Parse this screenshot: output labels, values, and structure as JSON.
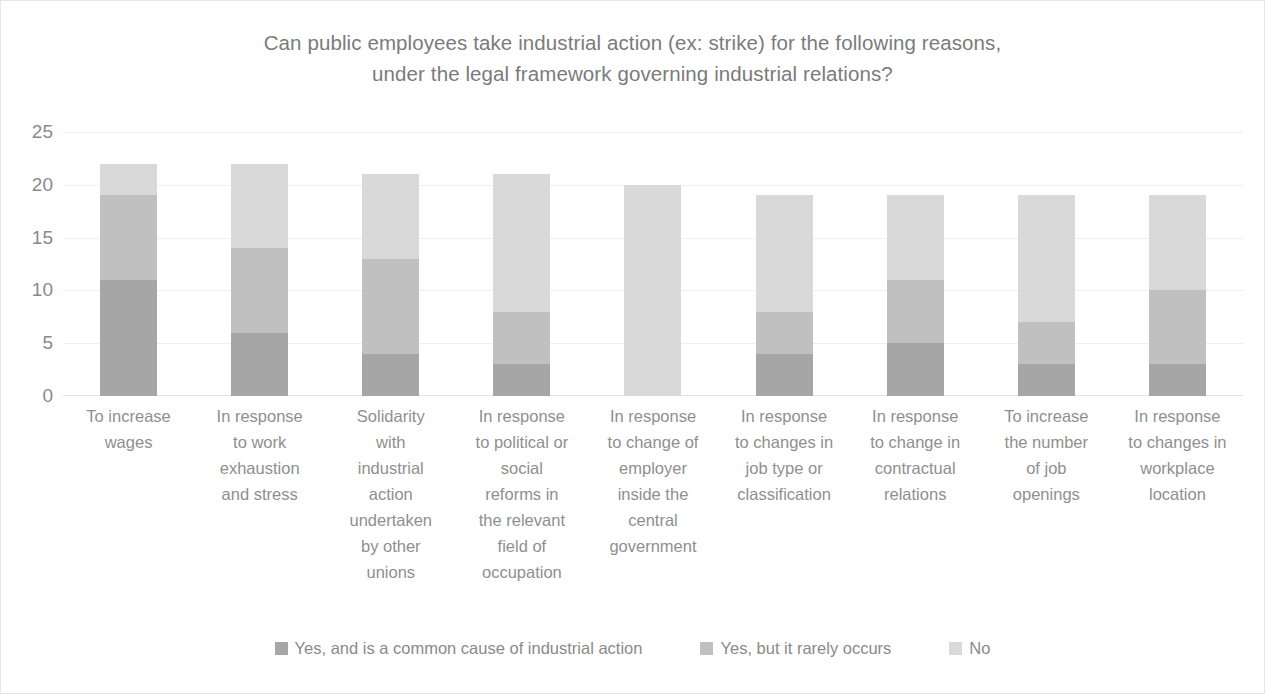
{
  "chart_data": {
    "type": "bar",
    "subtype": "stacked-column",
    "title": "Can public  employees take industrial  action (ex: strike) for the following reasons,\nunder the legal framework governing  industrial  relations?",
    "xlabel": "",
    "ylabel": "",
    "ylim": [
      0,
      25
    ],
    "yticks": [
      25,
      20,
      15,
      10,
      5,
      0
    ],
    "grid": true,
    "legend_position": "bottom",
    "categories": [
      "To increase\nwages",
      "In response\nto work\nexhaustion\nand stress",
      "Solidarity\nwith\nindustrial\naction\nundertaken\nby other\nunions",
      "In response\nto political or\nsocial\nreforms in\nthe relevant\nfield of\noccupation",
      "In response\nto change of\nemployer\ninside the\ncentral\ngovernment",
      "In response\nto changes in\njob type or\nclassification",
      "In response\nto change in\ncontractual\nrelations",
      "To increase\nthe number\nof job\nopenings",
      "In response\nto changes in\nworkplace\nlocation"
    ],
    "series": [
      {
        "name": "Yes, and is a common cause of industrial action",
        "color": "#a6a6a6",
        "values": [
          11,
          6,
          4,
          3,
          0,
          4,
          5,
          3,
          3
        ]
      },
      {
        "name": "Yes, but it rarely occurs",
        "color": "#c0c0c0",
        "values": [
          8,
          8,
          9,
          5,
          0,
          4,
          6,
          4,
          7
        ]
      },
      {
        "name": "No",
        "color": "#d9d9d9",
        "values": [
          3,
          8,
          8,
          13,
          20,
          11,
          8,
          12,
          9
        ]
      }
    ],
    "totals": [
      22,
      22,
      21,
      21,
      20,
      19,
      19,
      19,
      19
    ]
  },
  "colors": {
    "text": "#8a8a8a",
    "title": "#7b7b7b",
    "gridline": "#efefef",
    "background": "#ffffff"
  }
}
